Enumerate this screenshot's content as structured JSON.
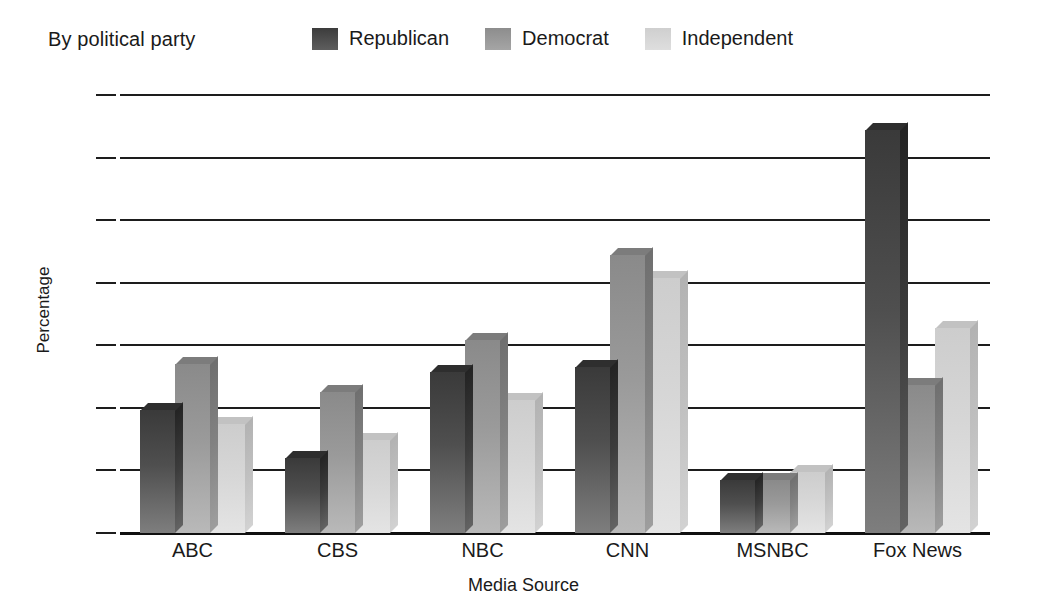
{
  "caption": "By political party",
  "legend": {
    "position": "top",
    "items": [
      {
        "label": "Republican",
        "key": "rep",
        "color": "#4a4a4a"
      },
      {
        "label": "Democrat",
        "key": "dem",
        "color": "#9a9a9a"
      },
      {
        "label": "Independent",
        "key": "ind",
        "color": "#d6d6d6"
      }
    ]
  },
  "chart_data": {
    "type": "bar",
    "title": "",
    "subtitle": "By political party",
    "xlabel": "Media Source",
    "ylabel": "Percentage",
    "ylim": [
      0,
      35
    ],
    "yticks": [
      0,
      5,
      10,
      15,
      20,
      25,
      30,
      35
    ],
    "grid": true,
    "legend_position": "top",
    "categories": [
      "ABC",
      "CBS",
      "NBC",
      "CNN",
      "MSNBC",
      "Fox News"
    ],
    "series": [
      {
        "name": "Republican",
        "values": [
          9.8,
          6.0,
          12.9,
          13.3,
          4.2,
          32.2
        ]
      },
      {
        "name": "Democrat",
        "values": [
          13.5,
          11.3,
          15.4,
          22.2,
          4.2,
          11.8
        ]
      },
      {
        "name": "Independent",
        "values": [
          8.7,
          7.4,
          10.6,
          20.4,
          4.9,
          16.4
        ]
      }
    ]
  }
}
